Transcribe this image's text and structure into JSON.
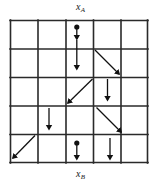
{
  "figure": {
    "type": "lattice-arrow-diagram",
    "background_color": "#ffffff",
    "line_color": "#2a2a2a",
    "arrow_color": "#111111",
    "grid": {
      "rows": 5,
      "cols": 5,
      "left": 10,
      "top": 20,
      "right": 148,
      "bottom": 163,
      "cell_width": 27.6,
      "cell_height": 28.6,
      "stroke_width": 1.6
    },
    "labels": {
      "top": {
        "text": "x",
        "subscript": "A"
      },
      "bottom": {
        "text": "x",
        "subscript": "B"
      }
    },
    "markers": [
      {
        "name": "source-dot-top",
        "cx": 76.8,
        "cy": 27,
        "r": 2.6
      },
      {
        "name": "source-dot-bottom",
        "cx": 76.8,
        "cy": 143,
        "r": 2.6
      }
    ],
    "arrows": [
      {
        "name": "arrow-col3-row1-upper",
        "kind": "vertical-down",
        "x1": 76.8,
        "y1": 27,
        "x2": 76.8,
        "y2": 39
      },
      {
        "name": "arrow-col3-row1-lower",
        "kind": "vertical-down",
        "x1": 76.8,
        "y1": 40,
        "x2": 76.8,
        "y2": 70
      },
      {
        "name": "arrow-row2-col4-diagonal",
        "kind": "diagonal-down-right",
        "x1": 94.5,
        "y1": 49.5,
        "x2": 120,
        "y2": 75
      },
      {
        "name": "arrow-row3-col3-diagonal",
        "kind": "diagonal-down-left",
        "x1": 93,
        "y1": 78.5,
        "x2": 67.5,
        "y2": 104
      },
      {
        "name": "arrow-row3-col4-vertical",
        "kind": "vertical-down",
        "x1": 107.5,
        "y1": 79,
        "x2": 107.5,
        "y2": 101
      },
      {
        "name": "arrow-row4-col2-vertical",
        "kind": "vertical-down",
        "x1": 49,
        "y1": 107,
        "x2": 49,
        "y2": 129
      },
      {
        "name": "arrow-row4-col4-diagonal",
        "kind": "diagonal-down-right",
        "x1": 96,
        "y1": 107,
        "x2": 122,
        "y2": 133
      },
      {
        "name": "arrow-row5-col1-diagonal",
        "kind": "diagonal-down-left",
        "x1": 36,
        "y1": 135,
        "x2": 12,
        "y2": 160
      },
      {
        "name": "arrow-row5-col3-vertical",
        "kind": "vertical-down",
        "x1": 76.8,
        "y1": 143,
        "x2": 76.8,
        "y2": 160
      },
      {
        "name": "arrow-row5-col4-vertical",
        "kind": "vertical-down",
        "x1": 110,
        "y1": 137,
        "x2": 110,
        "y2": 160
      }
    ]
  }
}
